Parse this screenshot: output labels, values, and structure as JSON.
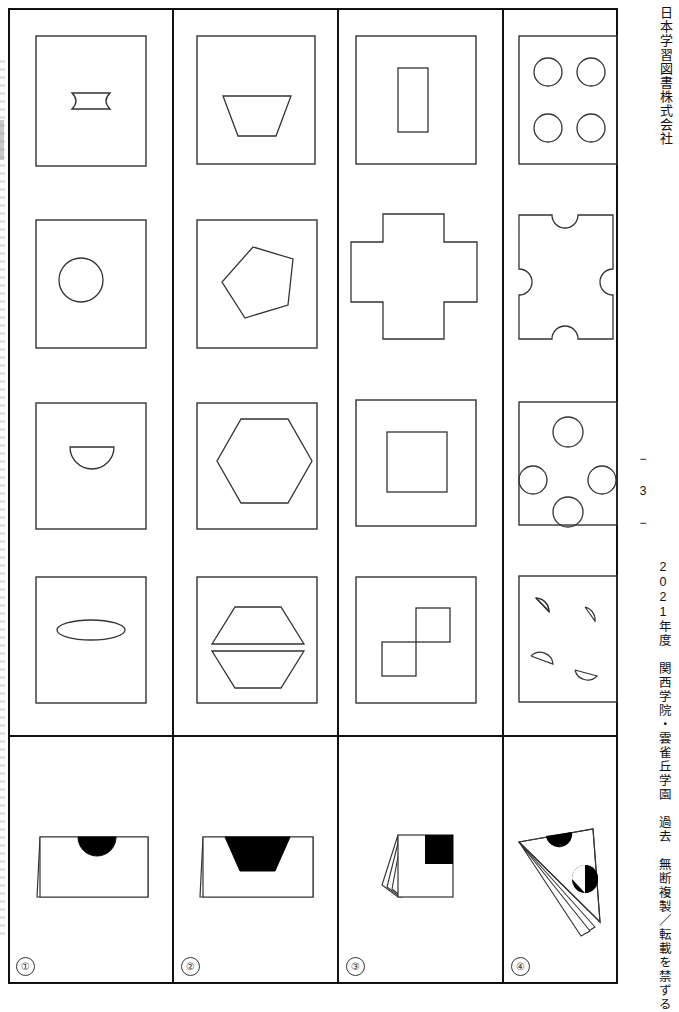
{
  "page": {
    "publisher": "日本学習図書株式会社",
    "credit": "2021年度　関西学院・雲雀丘学園　過去　無断複製／転載を禁ずる",
    "page_number": "− 3 −",
    "width": 679,
    "height": 992,
    "ink_color": "#111111",
    "paper_color": "#ffffff"
  },
  "grid": {
    "columns": 4,
    "shape_rows": 4,
    "answer_row_label": "folded-paper-row",
    "column_x": [
      8,
      172,
      337,
      502,
      618
    ],
    "row_y": [
      8,
      190,
      375,
      550,
      735,
      984
    ]
  },
  "rows": [
    {
      "row": 1,
      "cells": [
        {
          "column": 1,
          "frame": "square",
          "shape": "concave-sided-rectangle",
          "shape_label": "bowtie-rectangle"
        },
        {
          "column": 2,
          "frame": "square",
          "shape": "trapezoid",
          "shape_label": "inverted-trapezoid"
        },
        {
          "column": 3,
          "frame": "square",
          "shape": "rectangle",
          "shape_label": "vertical-rectangle"
        },
        {
          "column": 4,
          "frame": "square",
          "shape": "four-circles-grid",
          "shape_label": "four-circles-square-layout",
          "count": 4
        }
      ]
    },
    {
      "row": 2,
      "cells": [
        {
          "column": 1,
          "frame": "square",
          "shape": "circle",
          "shape_label": "circle"
        },
        {
          "column": 2,
          "frame": "square",
          "shape": "pentagon",
          "shape_label": "tilted-pentagon"
        },
        {
          "column": 3,
          "frame": "none",
          "shape": "cross",
          "shape_label": "plus-cross"
        },
        {
          "column": 4,
          "frame": "none",
          "shape": "square-with-four-notches",
          "shape_label": "square-semicircle-notches",
          "count": 4
        }
      ]
    },
    {
      "row": 3,
      "cells": [
        {
          "column": 1,
          "frame": "square",
          "shape": "half-circle",
          "shape_label": "lower-semicircle"
        },
        {
          "column": 2,
          "frame": "square",
          "shape": "hexagon",
          "shape_label": "hexagon"
        },
        {
          "column": 3,
          "frame": "square",
          "shape": "square",
          "shape_label": "inner-square"
        },
        {
          "column": 4,
          "frame": "square",
          "shape": "four-circles-diamond",
          "shape_label": "four-circles-diamond-layout",
          "count": 4
        }
      ]
    },
    {
      "row": 4,
      "cells": [
        {
          "column": 1,
          "frame": "square",
          "shape": "ellipse",
          "shape_label": "flat-ellipse"
        },
        {
          "column": 2,
          "frame": "square",
          "shape": "two-trapezoids",
          "shape_label": "hexagon-split-into-two-trapezoids"
        },
        {
          "column": 3,
          "frame": "square",
          "shape": "two-offset-squares",
          "shape_label": "two-diagonally-offset-squares"
        },
        {
          "column": 4,
          "frame": "square",
          "shape": "four-quarter-circles",
          "shape_label": "four-scattered-quarter-circles",
          "count": 4
        }
      ]
    }
  ],
  "answer_row": {
    "cells": [
      {
        "number": "①",
        "illustration": "folded-paper-rectangle-half-circle-cut",
        "fold": "single-left-flap",
        "cutout": "half-circle-top-center",
        "fill": "#000000"
      },
      {
        "number": "②",
        "illustration": "folded-paper-rectangle-trapezoid-cut",
        "fold": "single-left-flap",
        "cutout": "trapezoid-top-center",
        "fill": "#000000"
      },
      {
        "number": "③",
        "illustration": "folded-paper-square-corner-square-cut",
        "fold": "multi-left-flaps",
        "cutout": "square-top-right",
        "fill": "#000000"
      },
      {
        "number": "④",
        "illustration": "folded-paper-triangle-two-half-circle-cuts",
        "fold": "multi-diagonal-flaps",
        "cutout": "two-half-circles",
        "fill": "#000000"
      }
    ]
  }
}
